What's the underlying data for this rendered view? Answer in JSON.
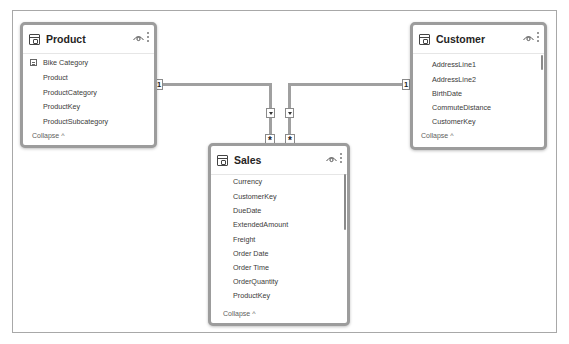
{
  "tables": {
    "product": {
      "name": "Product",
      "fields": [
        "Bike Category",
        "Product",
        "ProductCategory",
        "ProductKey",
        "ProductSubcategory"
      ],
      "collapse_label": "Collapse ^"
    },
    "customer": {
      "name": "Customer",
      "fields": [
        "AddressLine1",
        "AddressLine2",
        "BirthDate",
        "CommuteDistance",
        "CustomerKey"
      ],
      "collapse_label": "Collapse ^"
    },
    "sales": {
      "name": "Sales",
      "fields": [
        "Currency",
        "CustomerKey",
        "DueDate",
        "ExtendedAmount",
        "Freight",
        "Order Date",
        "Order Time",
        "OrderQuantity",
        "ProductKey"
      ],
      "collapse_label": "Collapse ^"
    }
  },
  "relationships": [
    {
      "from": "Product",
      "to": "Sales",
      "from_cardinality": "1",
      "to_cardinality": "*",
      "filter_direction": "single"
    },
    {
      "from": "Customer",
      "to": "Sales",
      "from_cardinality": "1",
      "to_cardinality": "*",
      "filter_direction": "single"
    }
  ],
  "colors": {
    "line": "#a0a0a0",
    "card_border": "#9c9c9c",
    "text": "#252423"
  }
}
